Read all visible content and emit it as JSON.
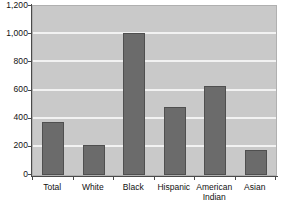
{
  "chart_data": {
    "type": "bar",
    "title": "",
    "subtitle": "",
    "xlabel": "",
    "ylabel": "",
    "categories": [
      "Total",
      "White",
      "Black",
      "Hispanic",
      "American Indian",
      "Asian"
    ],
    "category_lines": [
      [
        "Total"
      ],
      [
        "White"
      ],
      [
        "Black"
      ],
      [
        "Hispanic"
      ],
      [
        "American",
        "Indian"
      ],
      [
        "Asian"
      ]
    ],
    "values": [
      373,
      213,
      1005,
      485,
      632,
      180
    ],
    "ylim": [
      0,
      1200
    ],
    "yticks": [
      0,
      200,
      400,
      600,
      800,
      1000,
      1200
    ],
    "ytick_labels": [
      "0",
      "200",
      "400",
      "600",
      "800",
      "1,000",
      "1,200"
    ],
    "grid": true,
    "grid_axis": "y",
    "legend": null,
    "legend_position": "none",
    "colors": {
      "bar_fill": "#6b6b6b",
      "bar_border": "#4f4f4f",
      "plot_background": "#c9c9c9",
      "gridline": "#f2f2f2",
      "axis": "#4a4a4a",
      "text": "#111111",
      "page_background": "#ffffff"
    }
  }
}
